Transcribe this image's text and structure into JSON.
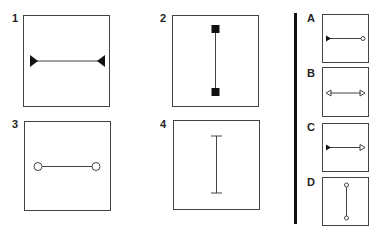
{
  "question_figures": [
    {
      "label": "1",
      "description": "horizontal line with filled triangle ends pointing inward"
    },
    {
      "label": "2",
      "description": "vertical line with filled square ends"
    },
    {
      "label": "3",
      "description": "horizontal line with hollow circle ends"
    },
    {
      "label": "4",
      "description": "vertical line with short perpendicular bar ends"
    }
  ],
  "answer_options": [
    {
      "label": "A",
      "description": "horizontal line, filled triangle left, hollow circle right"
    },
    {
      "label": "B",
      "description": "horizontal line with hollow arrowheads pointing outward"
    },
    {
      "label": "C",
      "description": "horizontal line, filled triangle left, hollow arrowhead right"
    },
    {
      "label": "D",
      "description": "vertical line with hollow circle ends"
    }
  ],
  "colors": {
    "stroke": "#444444",
    "fill": "#111111",
    "divider": "#111111"
  }
}
